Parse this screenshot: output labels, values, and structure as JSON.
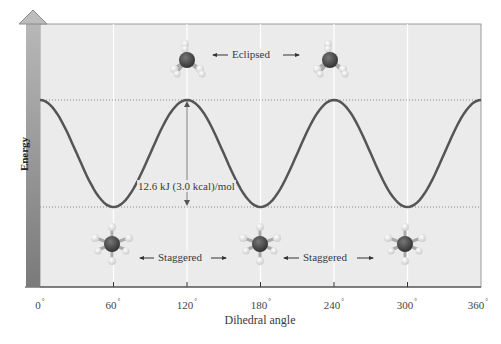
{
  "chart_data": {
    "type": "line",
    "title": "",
    "xlabel": "Dihedral angle",
    "ylabel": "Energy",
    "x_ticks": [
      "0°",
      "60°",
      "120°",
      "180°",
      "240°",
      "300°",
      "360°"
    ],
    "xlim": [
      0,
      360
    ],
    "ylim_relative_kJ": [
      0,
      12.6
    ],
    "grid": "vertical lines at 60° intervals",
    "series": [
      {
        "name": "Torsional energy of ethane",
        "x": [
          0,
          30,
          60,
          90,
          120,
          150,
          180,
          210,
          240,
          270,
          300,
          330,
          360
        ],
        "values": [
          12.6,
          6.3,
          0,
          6.3,
          12.6,
          6.3,
          0,
          6.3,
          12.6,
          6.3,
          0,
          6.3,
          12.6
        ]
      }
    ],
    "reference_lines": [
      {
        "label": "max energy (eclipsed)",
        "value_kJ": 12.6,
        "style": "dotted"
      },
      {
        "label": "min energy (staggered)",
        "value_kJ": 0,
        "style": "dotted"
      }
    ],
    "annotations": [
      {
        "text": "12.6 kJ (3.0 kcal)/mol",
        "x": 120,
        "type": "double-arrow energy barrier"
      },
      {
        "text": "Eclipsed",
        "positions": [
          120,
          240
        ],
        "type": "conformation label"
      },
      {
        "text": "Staggered",
        "positions": [
          60,
          180
        ],
        "type": "conformation label"
      },
      {
        "text": "Staggered",
        "positions": [
          180,
          300
        ],
        "type": "conformation label"
      }
    ]
  },
  "labels": {
    "ylabel": "Energy",
    "xlabel": "Dihedral angle",
    "barrier": "12.6 kJ (3.0 kcal)/mol",
    "eclipsed": "Eclipsed",
    "staggered_1": "Staggered",
    "staggered_2": "Staggered",
    "degree": "°",
    "ticks": [
      "0",
      "60",
      "120",
      "180",
      "240",
      "300",
      "360"
    ]
  },
  "colors": {
    "plot_bg": "#ebebeb",
    "curve": "#555555",
    "axis_bar": "#8a8a8a",
    "carbon": "#4a4a4a",
    "hydrogen": "#f2f2f2"
  }
}
